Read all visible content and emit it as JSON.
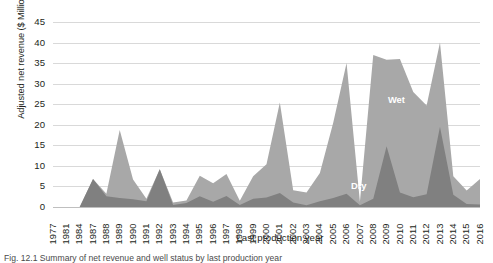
{
  "figure": {
    "caption": "Fig. 12.1 Summary of net revenue and well status by last production year"
  },
  "chart_data": {
    "type": "area",
    "stacked": true,
    "title": "",
    "xlabel": "Last production year",
    "ylabel": "Adjusted net revenue ($ Million)",
    "ylim": [
      0,
      45
    ],
    "ytick_step": 5,
    "yticks": [
      "45",
      "40",
      "35",
      "30",
      "25",
      "20",
      "15",
      "10",
      "5",
      "0"
    ],
    "grid": true,
    "legend_position": "inline-labels",
    "colors": {
      "dry": "#808080",
      "wet": "#a8a8a8",
      "gridline": "#d9d9d9",
      "text": "#231f20",
      "inline_label": "#ffffff"
    },
    "categories": [
      "1977",
      "1981",
      "1984",
      "1987",
      "1988",
      "1989",
      "1990",
      "1991",
      "1992",
      "1993",
      "1994",
      "1995",
      "1996",
      "1997",
      "1998",
      "1999",
      "2000",
      "2001",
      "2002",
      "2003",
      "2004",
      "2005",
      "2006",
      "2007",
      "2008",
      "2009",
      "2010",
      "2011",
      "2012",
      "2013",
      "2014",
      "2015",
      "2016"
    ],
    "series": [
      {
        "name": "Dry",
        "color": "#808080",
        "stack_order": 0,
        "values": [
          0,
          0,
          0,
          6.8,
          2.6,
          2.2,
          1.9,
          1.4,
          9.2,
          0.5,
          1.0,
          2.6,
          1.3,
          2.7,
          0.5,
          2.0,
          2.3,
          3.4,
          1.1,
          0.4,
          1.4,
          2.2,
          3.2,
          0.4,
          2.0,
          14.8,
          3.5,
          2.4,
          3.1,
          19.5,
          3.0,
          0.7,
          0.6
        ]
      },
      {
        "name": "Wet",
        "color": "#a8a8a8",
        "stack_order": 1,
        "values": [
          0,
          0,
          0,
          0.0,
          0.6,
          16.5,
          4.8,
          0.6,
          0.0,
          0.6,
          0.6,
          5.0,
          4.5,
          5.3,
          1.0,
          5.5,
          8.1,
          22.0,
          3.0,
          3.1,
          6.9,
          18.3,
          31.8,
          0.9,
          35.0,
          21.0,
          32.5,
          25.6,
          21.6,
          20.5,
          4.5,
          3.3,
          6.2
        ]
      }
    ],
    "inline_labels": [
      {
        "text": "Wet",
        "x_year": "2010",
        "y_value": 26
      },
      {
        "text": "Dry",
        "x_year": "2007",
        "y_value": 5
      }
    ],
    "totals": [
      0,
      0,
      0,
      6.8,
      3.2,
      18.7,
      6.7,
      2.0,
      9.2,
      1.1,
      1.6,
      7.6,
      5.8,
      8.0,
      1.5,
      7.5,
      10.4,
      25.4,
      4.1,
      3.5,
      8.3,
      20.5,
      35.0,
      1.3,
      37.0,
      35.8,
      36.0,
      28.0,
      24.7,
      40.0,
      7.5,
      4.0,
      6.8
    ]
  }
}
